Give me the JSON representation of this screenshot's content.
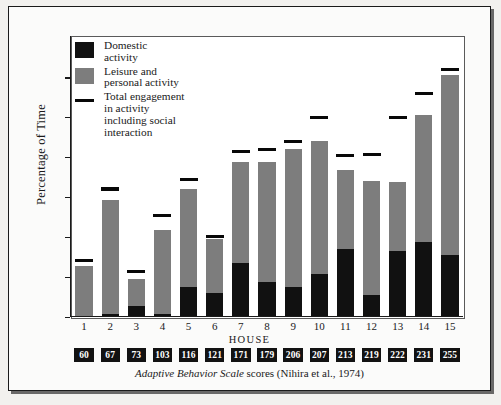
{
  "chart_data": {
    "type": "bar",
    "subtype": "stacked-bar-with-markers",
    "title": "",
    "xlabel": "HOUSE",
    "ylabel": "Percentage of Time",
    "ylim": [
      0,
      97
    ],
    "yticks": [
      0,
      15,
      30,
      45,
      60,
      75,
      90
    ],
    "grid": false,
    "legend_position": "top-left-inside",
    "categories": [
      "1",
      "2",
      "3",
      "4",
      "5",
      "6",
      "7",
      "8",
      "9",
      "10",
      "11",
      "12",
      "13",
      "14",
      "15"
    ],
    "series": [
      {
        "name": "Domestic activity",
        "color": "#111111",
        "values": [
          0,
          1,
          4,
          1,
          11,
          9,
          20,
          13,
          11,
          16,
          25.5,
          8,
          24.5,
          28,
          23
        ]
      },
      {
        "name": "Leisure and personal activity",
        "color": "#7d7d7d",
        "values": [
          19,
          43,
          10,
          31.5,
          37,
          20,
          38,
          45,
          52,
          50,
          29.5,
          43,
          26,
          48,
          68
        ]
      }
    ],
    "stacked_totals": [
      19,
      44,
      14,
      32.5,
      48,
      29,
      58,
      58,
      63,
      66,
      55,
      51,
      50.5,
      76,
      91
    ],
    "marker_series": {
      "name": "Total engagement in activity including social interaction",
      "color": "#080808",
      "values": [
        21,
        48,
        17,
        38,
        51.5,
        30,
        62,
        63,
        66,
        75,
        60.5,
        61,
        75,
        84,
        93
      ]
    },
    "secondary_axis": {
      "caption_italic": "Adaptive Behavior Scale",
      "caption_rest": " scores (Nihira et al., 1974)",
      "labels": [
        "60",
        "67",
        "73",
        "103",
        "116",
        "121",
        "171",
        "179",
        "206",
        "207",
        "213",
        "219",
        "222",
        "231",
        "255"
      ]
    }
  },
  "legend": {
    "items": [
      {
        "swatch": "black-square-swatch",
        "line1": "Domestic",
        "line2": "activity",
        "line3": "",
        "line4": ""
      },
      {
        "swatch": "grey-square-swatch",
        "line1": "Leisure and",
        "line2": "personal activity",
        "line3": "",
        "line4": ""
      },
      {
        "swatch": "black-line-swatch",
        "line1": "Total engagement",
        "line2": "in activity",
        "line3": "including social",
        "line4": "interaction"
      }
    ]
  },
  "axis": {
    "ylabel": "Percentage of Time",
    "xlabel": "HOUSE",
    "yticks": [
      "90",
      "75",
      "60",
      "45",
      "30",
      "15",
      "0"
    ]
  }
}
